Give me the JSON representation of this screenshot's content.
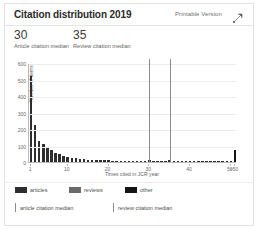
{
  "card": {
    "title": "Citation distribution 2019",
    "printable_label": "Printable Version",
    "expand_icon": "expand-arrows-icon"
  },
  "stats": [
    {
      "value": "30",
      "label": "Article citation median",
      "key": "article"
    },
    {
      "value": "35",
      "label": "Review citation median",
      "key": "review"
    }
  ],
  "legend": {
    "swatches": [
      {
        "label": "articles",
        "color": "#2e2e2e"
      },
      {
        "label": "reviews",
        "color": "#6a6a6a"
      },
      {
        "label": "other",
        "color": "#141414"
      }
    ],
    "rules": [
      {
        "label": "article citation median",
        "color": "#8c8c8c"
      },
      {
        "label": "review citation median",
        "color": "#8c8c8c"
      }
    ]
  },
  "colors": {
    "articles": "#2e2e2e",
    "reviews": "#6a6a6a",
    "other": "#141414",
    "median_line": "#8c8c8c",
    "grid": "#ececec",
    "axis": "#b9b9b9",
    "card_border": "#e2e2e2"
  },
  "chart_data": {
    "type": "bar",
    "title": "Citation distribution 2019",
    "xlabel": "Times cited in JCR year",
    "ylabel": "Number of items",
    "ylim": [
      0,
      600
    ],
    "yticks": [
      0,
      100,
      200,
      300,
      400,
      500,
      600
    ],
    "xticks": [
      1,
      10,
      20,
      30,
      40,
      50
    ],
    "xtick_labels": [
      "1",
      "10",
      "20",
      "30",
      "40",
      "50",
      ">50"
    ],
    "grid": true,
    "legend_position": "bottom",
    "categories": [
      "1",
      "2",
      "3",
      "4",
      "5",
      "6",
      "7",
      "8",
      "9",
      "10",
      "11",
      "12",
      "13",
      "14",
      "15",
      "16",
      "17",
      "18",
      "19",
      "20",
      "21",
      "22",
      "23",
      "24",
      "25",
      "26",
      "27",
      "28",
      "29",
      "30",
      "31",
      "32",
      "33",
      "34",
      "35",
      "36",
      "37",
      "38",
      "39",
      "40",
      "41",
      "42",
      "43",
      "44",
      "45",
      "46",
      "47",
      "48",
      "49",
      "50",
      ">50"
    ],
    "values": [
      520,
      225,
      130,
      112,
      86,
      70,
      56,
      46,
      36,
      30,
      26,
      22,
      19,
      16,
      14,
      13,
      12,
      11,
      10,
      14,
      9,
      8,
      8,
      7,
      7,
      6,
      6,
      6,
      5,
      12,
      5,
      5,
      4,
      4,
      12,
      4,
      4,
      3,
      3,
      8,
      3,
      3,
      3,
      2,
      2,
      2,
      2,
      2,
      2,
      4,
      74
    ],
    "annotations": [
      {
        "type": "vline",
        "label": "article citation median",
        "x": 30
      },
      {
        "type": "vline",
        "label": "review citation median",
        "x": 35
      }
    ],
    "medians": {
      "article": 30,
      "review": 35
    }
  }
}
